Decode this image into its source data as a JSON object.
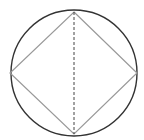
{
  "diagram": {
    "type": "geometry",
    "colors": {
      "background": "#ffffff",
      "circle_stroke": "#333333",
      "square_stroke": "#999999",
      "diagonal_stroke": "#444444"
    },
    "circle": {
      "cx": 74,
      "cy": 73,
      "r": 63
    },
    "square_vertices": [
      {
        "name": "top",
        "x": 74,
        "y": 12
      },
      {
        "name": "right",
        "x": 137,
        "y": 73
      },
      {
        "name": "bottom",
        "x": 74,
        "y": 134
      },
      {
        "name": "left",
        "x": 10,
        "y": 73
      }
    ],
    "diagonal": {
      "x1": 74,
      "y1": 12,
      "x2": 74,
      "y2": 134,
      "style": "dashed"
    }
  }
}
